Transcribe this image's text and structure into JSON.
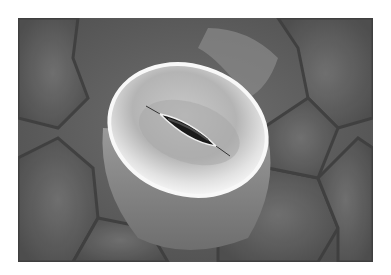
{
  "image": {
    "subject": "SEM micrograph of a plant stoma",
    "alt": "Scanning electron micrograph of a leaf stoma with two guard cells surrounding a dark slit-like pore, set among epidermal cells",
    "colors": {
      "background": "#5a5a5a",
      "guard_cell_highlight": "#e6e6e6",
      "pore": "#1a1a1a",
      "margin": "#ffffff"
    }
  }
}
